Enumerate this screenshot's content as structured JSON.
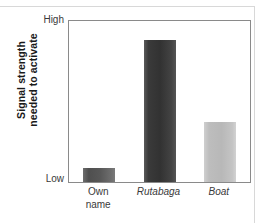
{
  "chart_data": {
    "type": "bar",
    "title": "",
    "subtitle": "",
    "xlabel": "",
    "ylabel": "Signal strength needed to activate",
    "ylabel_lines": [
      "Signal strength",
      "needed to activate"
    ],
    "categories": [
      "Own\nname",
      "Rutabaga",
      "Boat"
    ],
    "category_styles": [
      "normal",
      "italic",
      "italic"
    ],
    "values": [
      0.09,
      0.88,
      0.37
    ],
    "ylim": [
      0,
      1
    ],
    "ytick_labels": [
      "Low",
      "High"
    ],
    "ytick_values": [
      0,
      1
    ],
    "grid": false,
    "legend": "none",
    "bar_colors": [
      "#595959",
      "#3d3d3d",
      "#bfbfbf"
    ],
    "axis_color": "#8a8a8a",
    "text_color": "#3a3a3a",
    "background": "#ffffff"
  },
  "axis": {
    "high_label": "High",
    "low_label": "Low"
  },
  "y_title": {
    "line1": "Signal strength",
    "line2": "needed to activate"
  },
  "bars": [
    {
      "label": "Own\nname",
      "value": 0.09,
      "color": "#595959"
    },
    {
      "label": "Rutabaga",
      "value": 0.88,
      "color": "#3d3d3d"
    },
    {
      "label": "Boat",
      "value": 0.37,
      "color": "#bfbfbf"
    }
  ]
}
